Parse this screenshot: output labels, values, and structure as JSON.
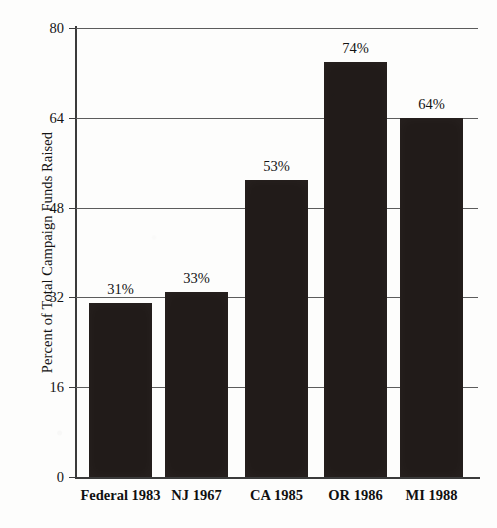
{
  "chart_data": {
    "type": "bar",
    "title": "",
    "subtitle": "",
    "xlabel": "",
    "ylabel": "Percent of Total Campaign Funds Raised",
    "categories": [
      "Federal 1983",
      "NJ 1967",
      "CA 1985",
      "OR 1986",
      "MI 1988"
    ],
    "values": [
      31,
      33,
      53,
      74,
      64
    ],
    "data_labels": [
      "31%",
      "33%",
      "53%",
      "74%",
      "64%"
    ],
    "ylim": [
      0,
      80
    ],
    "yticks": [
      0,
      16,
      32,
      48,
      64,
      80
    ],
    "ytick_labels": [
      "0",
      "16",
      "32",
      "48",
      "64",
      "80"
    ],
    "grid": "horizontal",
    "legend": "none",
    "series": [
      {
        "name": "Percent of Total Campaign Funds Raised",
        "values": [
          31,
          33,
          53,
          74,
          64
        ],
        "color": "#211b19"
      }
    ],
    "colors": {
      "bar": "#211b19",
      "axis": "#3b3b3b",
      "gridline": "#5c5c5c",
      "text": "#141414",
      "background": "#fdfdfc"
    }
  }
}
